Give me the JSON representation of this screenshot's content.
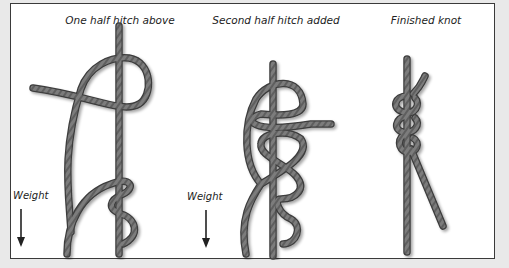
{
  "figure": {
    "panels": [
      {
        "caption": "One half hitch above",
        "weight_label": "Weight"
      },
      {
        "caption": "Second half hitch added",
        "weight_label": "Weight"
      },
      {
        "caption": "Finished knot"
      }
    ],
    "colors": {
      "rope": "#7a7a7a",
      "rope_edge": "#3c3c3c",
      "rope_highlight": "#a8a8a8",
      "frame_border": "#3a3a3a",
      "background": "#e9e9e9",
      "panel_bg": "#ffffff"
    },
    "icons": [
      "weight-arrow-down-icon",
      "weight-arrow-down-icon"
    ]
  }
}
